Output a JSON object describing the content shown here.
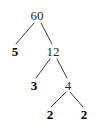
{
  "figure": {
    "background_color": "#ffffff",
    "edge_color": "#3a3a3a",
    "prime_color": "#000000",
    "composite_color": "#2b2b2b"
  },
  "chart_data": {
    "type": "diagram",
    "diagram_type": "factor-tree",
    "title": "",
    "root_value": 60,
    "prime_factorization": "60 = 2 x 2 x 3 x 5",
    "nodes": [
      {
        "id": "n60",
        "label": "60",
        "value": 60,
        "kind": "composite",
        "x": 37,
        "y": 15,
        "depth": 0
      },
      {
        "id": "n5",
        "label": "5",
        "value": 5,
        "kind": "prime",
        "x": 15,
        "y": 51,
        "depth": 1
      },
      {
        "id": "n12",
        "label": "12",
        "value": 12,
        "kind": "composite",
        "x": 53,
        "y": 51,
        "depth": 1
      },
      {
        "id": "n3",
        "label": "3",
        "value": 3,
        "kind": "prime",
        "x": 34,
        "y": 85,
        "depth": 2
      },
      {
        "id": "n4",
        "label": "4",
        "value": 4,
        "kind": "composite",
        "x": 68,
        "y": 85,
        "depth": 2
      },
      {
        "id": "n2a",
        "label": "2",
        "value": 2,
        "kind": "prime",
        "x": 50,
        "y": 114,
        "depth": 3
      },
      {
        "id": "n2b",
        "label": "2",
        "value": 2,
        "kind": "prime",
        "x": 84,
        "y": 114,
        "depth": 3
      }
    ],
    "edges": [
      {
        "from": "n60",
        "to": "n5",
        "x1": 34,
        "y1": 23,
        "x2": 16,
        "y2": 44
      },
      {
        "from": "n60",
        "to": "n12",
        "x1": 41,
        "y1": 23,
        "x2": 52,
        "y2": 44
      },
      {
        "from": "n12",
        "to": "n3",
        "x1": 50,
        "y1": 59,
        "x2": 36,
        "y2": 78
      },
      {
        "from": "n12",
        "to": "n4",
        "x1": 57,
        "y1": 59,
        "x2": 67,
        "y2": 78
      },
      {
        "from": "n4",
        "to": "n2a",
        "x1": 66,
        "y1": 92,
        "x2": 51,
        "y2": 107
      },
      {
        "from": "n4",
        "to": "n2b",
        "x1": 70,
        "y1": 92,
        "x2": 83,
        "y2": 107
      }
    ]
  }
}
